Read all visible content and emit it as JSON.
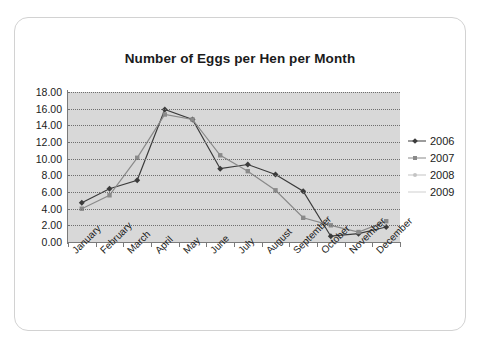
{
  "chart_data": {
    "type": "line",
    "title": "Number of Eggs per Hen per Month",
    "xlabel": "",
    "ylabel": "",
    "ylim": [
      0,
      18
    ],
    "ytick_step": 2,
    "ytick_labels": [
      "18.00",
      "16.00",
      "14.00",
      "12.00",
      "10.00",
      "8.00",
      "6.00",
      "4.00",
      "2.00",
      "0.00"
    ],
    "grid": true,
    "legend_position": "right",
    "plot_background": "#d8d8d8",
    "categories": [
      "January",
      "February",
      "March",
      "April",
      "May",
      "June",
      "July",
      "August",
      "September",
      "October",
      "November",
      "December"
    ],
    "series": [
      {
        "name": "2006",
        "color": "#3b3b3b",
        "marker": "diamond",
        "values": [
          4.7,
          6.4,
          7.4,
          15.9,
          14.7,
          8.8,
          9.3,
          8.1,
          6.1,
          0.7,
          1.0,
          1.8
        ]
      },
      {
        "name": "2007",
        "color": "#8a8a8a",
        "marker": "square",
        "values": [
          4.0,
          5.6,
          10.1,
          15.3,
          14.7,
          10.4,
          8.5,
          6.2,
          2.9,
          2.0,
          1.2,
          2.5
        ]
      },
      {
        "name": "2008",
        "color": "#c4c4c4",
        "marker": "dot",
        "values": [
          null,
          null,
          null,
          null,
          null,
          null,
          null,
          null,
          null,
          null,
          null,
          null
        ]
      },
      {
        "name": "2009",
        "color": "#d0d0d0",
        "marker": "line",
        "values": [
          null,
          null,
          null,
          null,
          null,
          null,
          null,
          null,
          null,
          null,
          null,
          null
        ]
      }
    ]
  },
  "legend": {
    "items": [
      {
        "label": "2006"
      },
      {
        "label": "2007"
      },
      {
        "label": "2008"
      },
      {
        "label": "2009"
      }
    ]
  }
}
